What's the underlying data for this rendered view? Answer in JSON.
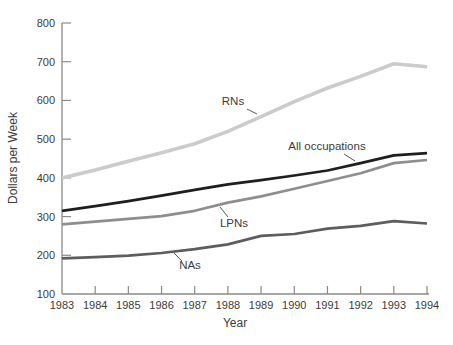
{
  "chart_data": {
    "type": "line",
    "title": "",
    "xlabel": "Year",
    "ylabel": "Dollars per Week",
    "x": [
      1983,
      1984,
      1985,
      1986,
      1987,
      1988,
      1989,
      1990,
      1991,
      1992,
      1993,
      1994
    ],
    "xlim": [
      1983,
      1994
    ],
    "ylim": [
      100,
      800
    ],
    "yticks": [
      100,
      200,
      300,
      400,
      500,
      600,
      700,
      800
    ],
    "grid": false,
    "legend": "inline series labels with leader lines",
    "axis_color": "#8a8a8a",
    "text_color": "#3b3b3b",
    "series": [
      {
        "name": "RNs",
        "color": "#cbcbcb",
        "line_width": 3.6,
        "values": [
          400,
          420,
          443,
          465,
          488,
          520,
          558,
          597,
          632,
          662,
          695,
          687
        ]
      },
      {
        "name": "NAs",
        "color": "#5d5d5d",
        "line_width": 2.7,
        "values": [
          192,
          195,
          199,
          206,
          216,
          228,
          250,
          255,
          269,
          276,
          288,
          282
        ]
      },
      {
        "name": "LPNs",
        "color": "#8e8e8e",
        "line_width": 2.7,
        "values": [
          280,
          287,
          294,
          301,
          315,
          336,
          352,
          372,
          392,
          412,
          438,
          446
        ]
      },
      {
        "name": "All occupations",
        "color": "#1e1e1e",
        "line_width": 2.7,
        "values": [
          315,
          327,
          340,
          354,
          369,
          383,
          394,
          406,
          419,
          438,
          458,
          464
        ]
      }
    ]
  }
}
